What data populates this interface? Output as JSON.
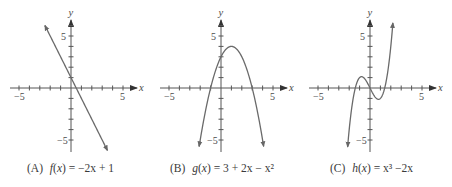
{
  "chart_data": [
    {
      "type": "line",
      "label": "(A)",
      "title": "f(x) = −2x + 1",
      "function": "-2x+1",
      "xlabel": "x",
      "ylabel": "y",
      "xlim": [
        -5.8,
        6.3
      ],
      "ylim": [
        -6.2,
        6.6
      ],
      "x_tick_labels": [
        "-5",
        "5"
      ],
      "y_tick_labels": [
        "5",
        "-5"
      ],
      "ticks_every": 1,
      "domain": [
        -2.5,
        3.5
      ],
      "x": [
        -2.5,
        -1,
        0,
        0.5,
        1,
        2,
        3.5
      ],
      "y": [
        6,
        3,
        1,
        0,
        -1,
        -3,
        -6
      ],
      "grid": false,
      "legend": null
    },
    {
      "type": "line",
      "label": "(B)",
      "title": "g(x) = 3 + 2x − x²",
      "function": "3+2x-x^2",
      "xlabel": "x",
      "ylabel": "y",
      "xlim": [
        -5.8,
        6.3
      ],
      "ylim": [
        -6.2,
        6.6
      ],
      "x_tick_labels": [
        "-5",
        "5"
      ],
      "y_tick_labels": [
        "5",
        "-5"
      ],
      "ticks_every": 1,
      "domain": [
        -2.1,
        4.1
      ],
      "x": [
        -2.1,
        -1,
        0,
        1,
        2,
        3,
        4.1
      ],
      "y": [
        -5.61,
        0,
        3,
        4,
        3,
        0,
        -5.61
      ],
      "grid": false,
      "legend": null
    },
    {
      "type": "line",
      "label": "(C)",
      "title": "h(x) = x³ − 2x",
      "function": "x^3-2x",
      "xlabel": "x",
      "ylabel": "y",
      "xlim": [
        -5.8,
        6.3
      ],
      "ylim": [
        -6.2,
        6.6
      ],
      "x_tick_labels": [
        "-5",
        "5"
      ],
      "y_tick_labels": [
        "5",
        "-5"
      ],
      "ticks_every": 1,
      "domain": [
        -2.15,
        2.2
      ],
      "x": [
        -2.15,
        -1.414,
        -0.816,
        0,
        0.816,
        1.414,
        2.2
      ],
      "y": [
        -5.64,
        0,
        1.09,
        0,
        -1.09,
        0,
        6.25
      ],
      "grid": false,
      "legend": null
    }
  ],
  "captions": [
    {
      "label": "(A)",
      "name": "f",
      "var": "x",
      "rhs": "= −2x + 1"
    },
    {
      "label": "(B)",
      "name": "g",
      "var": "x",
      "rhs": "= 3 + 2x − x²"
    },
    {
      "label": "(C)",
      "name": "h",
      "var": "x",
      "rhs": "= x³ −2x"
    }
  ],
  "axis": {
    "x_label": "x",
    "y_label": "y",
    "tick_neg": "−5",
    "tick_pos": "5",
    "axis_color": "#555555",
    "curve_color": "#6a6a6a"
  }
}
